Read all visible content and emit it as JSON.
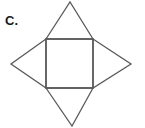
{
  "figure": {
    "label": "C.",
    "background_color": "#ffffff",
    "stroke_color": "#5a5a5a",
    "label_color": "#1a1a1a",
    "shapes": {
      "square": {
        "name": "central-square",
        "points": "46,39 93,39 93,88 46,88"
      },
      "triangle_top": {
        "name": "top-triangle",
        "apex": "70,2",
        "base_left": "46,39",
        "base_right": "93,39",
        "points": "46,39 70,2 93,39"
      },
      "triangle_right": {
        "name": "right-triangle",
        "apex": "131,64",
        "base_top": "93,39",
        "base_bottom": "93,88",
        "points": "93,39 131,64 93,88"
      },
      "triangle_bottom": {
        "name": "bottom-triangle",
        "apex": "72,126",
        "base_left": "46,88",
        "base_right": "93,88",
        "points": "46,88 72,126 93,88"
      },
      "triangle_left": {
        "name": "left-triangle",
        "apex": "11,64",
        "base_top": "46,39",
        "base_bottom": "46,88",
        "points": "46,39 11,64 46,88"
      }
    }
  }
}
